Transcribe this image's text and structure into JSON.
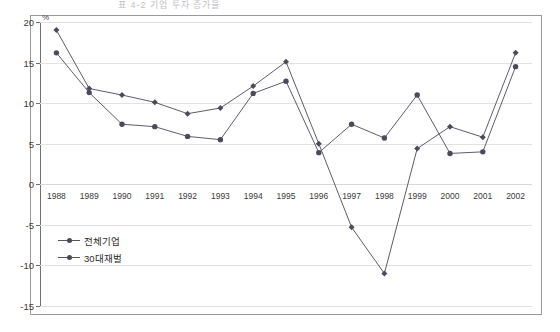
{
  "figure": {
    "clipped_title": "표 4-2  기업 투자 증가율",
    "unit_label": "%"
  },
  "legend": {
    "position": "inside-lower-left",
    "entries": [
      {
        "label": "전체기업",
        "color": "#4a4a5a",
        "marker": "diamond"
      },
      {
        "label": "30대재벌",
        "color": "#4a4a5a",
        "marker": "circle"
      }
    ]
  },
  "chart_data": {
    "type": "line",
    "title": "",
    "xlabel": "",
    "ylabel": "%",
    "ylim": [
      -15,
      20
    ],
    "yticks": [
      20,
      15,
      10,
      5,
      0,
      -5,
      -10,
      -15
    ],
    "ytick_labels": [
      "20",
      "15",
      "10",
      "5",
      "0",
      "-5",
      "-10",
      "-15"
    ],
    "grid": true,
    "grid_axis": "y",
    "categories": [
      "1988",
      "1989",
      "1990",
      "1991",
      "1992",
      "1993",
      "1994",
      "1995",
      "1996",
      "1997",
      "1998",
      "1999",
      "2000",
      "2001",
      "2002"
    ],
    "series": [
      {
        "name": "전체기업",
        "color": "#4a4a5a",
        "values": [
          19.0,
          11.8,
          11.0,
          10.1,
          8.7,
          9.4,
          12.1,
          15.1,
          5.0,
          -5.3,
          -11.0,
          4.4,
          7.1,
          5.8,
          16.2
        ]
      },
      {
        "name": "30대재벌",
        "color": "#4a4a5a",
        "values": [
          16.2,
          11.3,
          7.4,
          7.1,
          5.9,
          5.5,
          11.2,
          12.7,
          3.9,
          7.4,
          5.7,
          11.0,
          3.8,
          4.0,
          14.5
        ]
      }
    ]
  }
}
